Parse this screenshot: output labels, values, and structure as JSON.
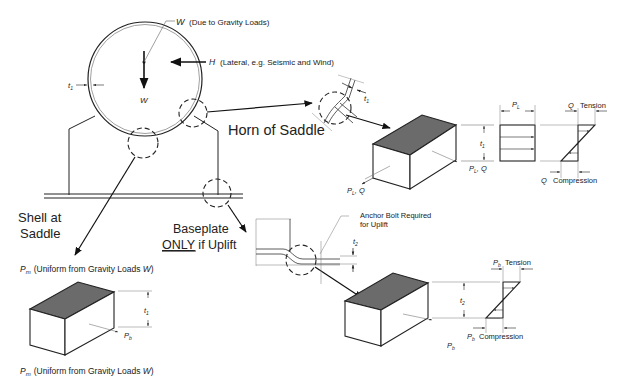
{
  "labels": {
    "w_gravity_sym": "W",
    "w_gravity_desc": "(Due to Gravity Loads)",
    "h_lateral_sym": "H",
    "h_lateral_desc": "(Lateral, e.g. Seismic and Wind)",
    "w_inner": "W",
    "t1_shell": "t",
    "t1_sub": "1",
    "horn_of_saddle": "Horn of Saddle",
    "shell_at_saddle_line1": "Shell at",
    "shell_at_saddle_line2": "Saddle",
    "baseplate_line1": "Baseplate",
    "baseplate_only": "ONLY",
    "baseplate_rest": " if Uplift",
    "anchor_bolt_line1": "Anchor Bolt Required",
    "anchor_bolt_line2": "for Uplift",
    "pm_sym": "P",
    "pm_sub": "m",
    "pm_desc_1": "(Uniform from Gravity Loads ",
    "pm_desc_w": "W",
    "pm_desc_2": ")",
    "horn_t1": "t",
    "horn_t1_sub": "1",
    "horn_block_plq_front": "P",
    "horn_block_plq_front_sub": "L",
    "horn_block_plq_front_rest": ", Q",
    "horn_block_plq_side": "P",
    "horn_block_plq_side_sub": "L",
    "horn_block_plq_side_rest": ", Q",
    "horn_block_t1": "t",
    "horn_block_t1_sub": "1",
    "pl_top": "P",
    "pl_top_sub": "L",
    "q_tension_sym": "Q",
    "q_tension_word": "Tension",
    "q_compression_sym": "Q",
    "q_compression_word": "Compression",
    "shell_block_t1": "t",
    "shell_block_t1_sub": "1",
    "shell_block_pb": "P",
    "shell_block_pb_sub": "b",
    "bp_t2": "t",
    "bp_t2_sub": "2",
    "bp_block_t2": "t",
    "bp_block_t2_sub": "2",
    "bp_block_pb": "P",
    "bp_block_pb_sub": "b",
    "pb_tension_sym": "P",
    "pb_tension_sub": "b",
    "pb_tension_word": "Tension",
    "pb_compression_sym": "P",
    "pb_compression_sub": "b",
    "pb_compression_word": "Compression"
  },
  "colors": {
    "line": "#222222",
    "shade": "#6b6b6b",
    "thin": "#555555"
  }
}
